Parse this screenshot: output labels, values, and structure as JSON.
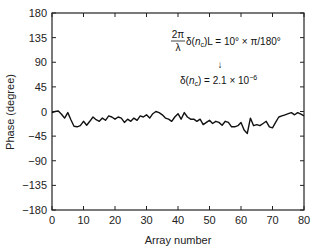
{
  "chart_data": {
    "type": "line",
    "title": "",
    "xlabel": "Array number",
    "ylabel": "Phase (degree)",
    "xlim": [
      0,
      80
    ],
    "ylim": [
      -180,
      180
    ],
    "xticks": [
      0,
      10,
      20,
      30,
      40,
      50,
      60,
      70,
      80
    ],
    "yticks": [
      180,
      135,
      90,
      45,
      0,
      -45,
      -90,
      -135,
      -180
    ],
    "grid": false,
    "legend": null,
    "series": [
      {
        "name": "Phase",
        "x": [
          0,
          1,
          2,
          3,
          4,
          5,
          6,
          7,
          8,
          9,
          10,
          11,
          12,
          13,
          14,
          15,
          16,
          17,
          18,
          19,
          20,
          21,
          22,
          23,
          24,
          25,
          26,
          27,
          28,
          29,
          30,
          31,
          32,
          33,
          34,
          35,
          36,
          37,
          38,
          39,
          40,
          41,
          42,
          43,
          44,
          45,
          46,
          47,
          48,
          49,
          50,
          51,
          52,
          53,
          54,
          55,
          56,
          57,
          58,
          59,
          60,
          61,
          62,
          63,
          64,
          65,
          66,
          67,
          68,
          69,
          70,
          71,
          72,
          73,
          74,
          75,
          76,
          77,
          78,
          79,
          80
        ],
        "values": [
          -2,
          0,
          1,
          -5,
          -12,
          -2,
          -15,
          -27,
          -28,
          -26,
          -18,
          -25,
          -18,
          -10,
          -15,
          -18,
          -12,
          -16,
          -8,
          -10,
          -14,
          -10,
          -12,
          -20,
          -14,
          -18,
          -12,
          -16,
          -8,
          -10,
          -6,
          -12,
          -4,
          0,
          -2,
          -6,
          -12,
          -14,
          -18,
          -10,
          -4,
          -14,
          -2,
          -10,
          -14,
          -14,
          -18,
          -14,
          -24,
          -20,
          -16,
          -22,
          -18,
          -20,
          -25,
          -18,
          -20,
          -28,
          -28,
          -26,
          -20,
          -34,
          -40,
          -12,
          -26,
          -24,
          -26,
          -22,
          -18,
          -28,
          -30,
          -20,
          -10,
          -8,
          -6,
          -4,
          -2,
          -6,
          -2,
          -5,
          -8
        ]
      }
    ],
    "annotations": [
      {
        "text_line1": "2π/λ δ(n_c)L = 10° × π/180°"
      },
      {
        "text_arrow": "↓"
      },
      {
        "text_line2": "δ(n_c) = 2.1 × 10^-6"
      }
    ]
  },
  "labels": {
    "xlabel": "Array number",
    "ylabel": "Phase (degree)",
    "anno_frac_num": "2π",
    "anno_frac_den": "λ",
    "anno_delta_open": "δ(",
    "anno_n": "n",
    "anno_c": "c",
    "anno_eq1_rest": ")L = 10° × π/180°",
    "anno_arrow": "↓",
    "anno_eq2_pre": "δ(",
    "anno_eq2_rest": ") = 2.1 × 10",
    "anno_exp": "−6"
  },
  "colors": {
    "line": "#111111",
    "axis": "#222222",
    "background": "#ffffff"
  }
}
